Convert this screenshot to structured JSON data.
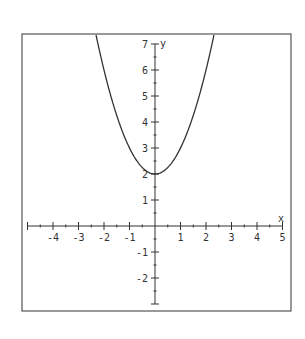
{
  "chart_data": {
    "type": "line",
    "title": "",
    "equation": "y = x^2 + 2",
    "xlabel": "x",
    "ylabel": "y",
    "xlim": [
      -5,
      5
    ],
    "ylim": [
      -3,
      7
    ],
    "x_ticks": [
      -4,
      -3,
      -2,
      -1,
      1,
      2,
      3,
      4,
      5
    ],
    "y_ticks": [
      -2,
      -1,
      1,
      2,
      3,
      4,
      5,
      6,
      7
    ],
    "minor_ticks_per_unit": 2,
    "grid": false,
    "legend": null,
    "series": [
      {
        "name": "parabola",
        "x": [
          -2.24,
          -2,
          -1.5,
          -1,
          -0.5,
          0,
          0.5,
          1,
          1.5,
          2,
          2.24
        ],
        "values": [
          7,
          6,
          4.25,
          3,
          2.25,
          2,
          2.25,
          3,
          4.25,
          6,
          7
        ]
      }
    ],
    "vertex": [
      0,
      2
    ],
    "colors": {
      "curve": "#333333",
      "axes": "#333333",
      "frame": "#555555",
      "background": "#ffffff"
    }
  }
}
